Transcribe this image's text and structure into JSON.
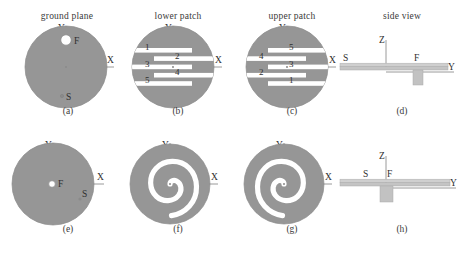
{
  "figure": {
    "columns": [
      {
        "title": "ground plane"
      },
      {
        "title": "lower patch"
      },
      {
        "title": "upper patch"
      },
      {
        "title": "side view"
      }
    ],
    "captions": {
      "a": "(a)",
      "b": "(b)",
      "c": "(c)",
      "d": "(d)",
      "e": "(e)",
      "f": "(f)",
      "g": "(g)",
      "h": "(h)"
    },
    "axis_labels": {
      "x": "X",
      "y": "Y",
      "z": "Z",
      "y_side": "Y"
    },
    "point_labels": {
      "feed": "F",
      "short": "S"
    },
    "slot_numbers_lower": [
      "1",
      "2",
      "3",
      "4",
      "5"
    ],
    "slot_numbers_upper": [
      "5",
      "4",
      "3",
      "2",
      "1"
    ],
    "colors": {
      "metal": "#969696",
      "metal_edge": "#8a8a8a",
      "substrate": "#c9c9c9",
      "substrate_edge": "#a8a8a8",
      "post": "#c2c2c2",
      "axis": "#8f8f8f",
      "text": "#2f2f2f",
      "background": "#ffffff"
    },
    "geometry": {
      "disc_radius_px": 41,
      "spiral_turns": 2,
      "meander_slot_count": 5
    }
  }
}
